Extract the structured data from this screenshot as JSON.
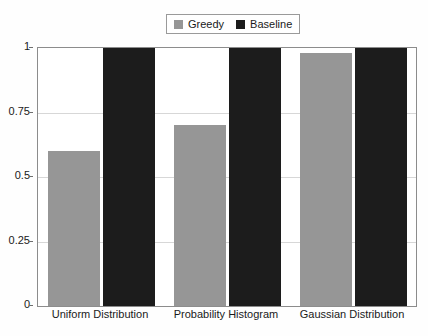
{
  "chart_data": {
    "type": "bar",
    "title": "",
    "xlabel": "",
    "ylabel": "",
    "categories": [
      "Uniform Distribution",
      "Probability Histogram",
      "Gaussian Distribution"
    ],
    "series": [
      {
        "name": "Greedy",
        "color": "#969696",
        "values": [
          0.6,
          0.7,
          0.98
        ]
      },
      {
        "name": "Baseline",
        "color": "#1c1c1c",
        "values": [
          1.0,
          1.0,
          1.0
        ]
      }
    ],
    "ylim": [
      0,
      1
    ],
    "yticks": [
      "0",
      "0.25",
      "0.5",
      "0.75",
      "1"
    ],
    "ytick_values": [
      0,
      0.25,
      0.5,
      0.75,
      1
    ],
    "grid": true,
    "legend_position": "top-center"
  },
  "legend": {
    "entries": [
      {
        "label": "Greedy",
        "swatch_color": "#969696"
      },
      {
        "label": "Baseline",
        "swatch_color": "#1c1c1c"
      }
    ]
  },
  "axes": {
    "y_tick_labels": [
      "1",
      "0.75",
      "0.5",
      "0.25",
      "0"
    ],
    "x_tick_labels": [
      "Uniform Distribution",
      "Probability Histogram",
      "Gaussian Distribution"
    ]
  },
  "colors": {
    "greedy": "#969696",
    "baseline": "#1c1c1c",
    "gridline": "#d7d7d7",
    "axis_border": "#8c8c8c",
    "background": "#fefefe"
  }
}
